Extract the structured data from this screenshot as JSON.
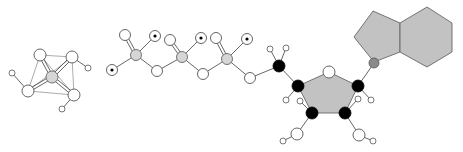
{
  "figure": {
    "title": "",
    "colors": {
      "background": "#ffffff",
      "ring_fill": "#c2c2c2",
      "phosphorus_fill": "#d6d6d6",
      "carbon_fill": "#000000",
      "nitrogen_fill": "#8a8a8a",
      "oxygen_fill": "#ffffff"
    }
  },
  "cluster": {
    "center": {
      "x": 52,
      "y": 77
    },
    "vertices": [
      {
        "x": 40,
        "y": 55
      },
      {
        "x": 72,
        "y": 57
      },
      {
        "x": 28,
        "y": 91
      },
      {
        "x": 74,
        "y": 95
      }
    ],
    "hydrogens": [
      {
        "x": 12,
        "y": 73,
        "from": 2
      },
      {
        "x": 88,
        "y": 68,
        "from": 1
      },
      {
        "x": 62,
        "y": 109,
        "from": 3
      }
    ]
  },
  "phosphate_chain": {
    "phosphorus": [
      {
        "x": 136,
        "y": 55
      },
      {
        "x": 182,
        "y": 57
      },
      {
        "x": 227,
        "y": 59
      }
    ],
    "double_bond_oxygens": [
      {
        "x": 125,
        "y": 35
      },
      {
        "x": 170,
        "y": 40
      },
      {
        "x": 216,
        "y": 38
      }
    ],
    "charged_oxygens": [
      {
        "x": 155,
        "y": 36
      },
      {
        "x": 201,
        "y": 38
      },
      {
        "x": 247,
        "y": 39
      },
      {
        "x": 112,
        "y": 70
      }
    ],
    "bridge_oxygens": [
      {
        "x": 157,
        "y": 71
      },
      {
        "x": 203,
        "y": 74
      },
      {
        "x": 250,
        "y": 78
      }
    ]
  },
  "ribose": {
    "c5": {
      "x": 279,
      "y": 66
    },
    "c5_h": [
      {
        "x": 270,
        "y": 49
      },
      {
        "x": 286,
        "y": 48
      }
    ],
    "ring": [
      {
        "x": 298,
        "y": 86
      },
      {
        "x": 329,
        "y": 72
      },
      {
        "x": 358,
        "y": 86
      },
      {
        "x": 345,
        "y": 113
      },
      {
        "x": 312,
        "y": 113
      }
    ],
    "ring_oxygen_index": 1,
    "ring_h": [
      {
        "x": 286,
        "y": 100,
        "from": 0
      },
      {
        "x": 371,
        "y": 100,
        "from": 2
      },
      {
        "x": 358,
        "y": 99,
        "from": 3
      },
      {
        "x": 300,
        "y": 101,
        "from": 4
      }
    ],
    "hydroxyls": [
      {
        "o": {
          "x": 359,
          "y": 135
        },
        "h": {
          "x": 373,
          "y": 141
        },
        "from": 3
      },
      {
        "o": {
          "x": 297,
          "y": 134
        },
        "h": {
          "x": 283,
          "y": 141
        },
        "from": 4
      }
    ]
  },
  "base": {
    "n9": {
      "x": 374,
      "y": 63
    },
    "pentagon": [
      [
        373,
        11
      ],
      [
        400,
        23
      ],
      [
        400,
        52
      ],
      [
        374,
        62
      ],
      [
        354,
        37
      ]
    ],
    "hexagon": [
      [
        400,
        23
      ],
      [
        427,
        7
      ],
      [
        452,
        23
      ],
      [
        452,
        52
      ],
      [
        427,
        67
      ],
      [
        400,
        52
      ]
    ]
  }
}
